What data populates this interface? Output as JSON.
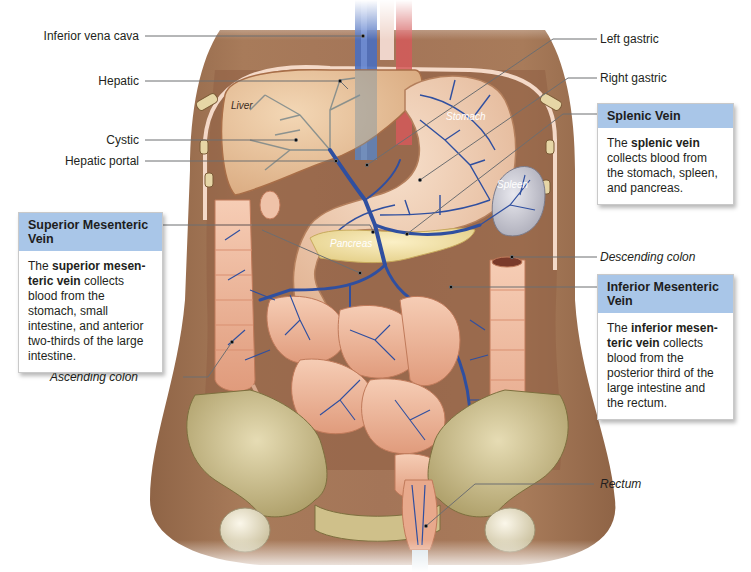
{
  "figure": {
    "top_cut_text": "Hepatic Portal System, continued",
    "organ_labels": [
      {
        "id": "liver",
        "text": "Liver"
      },
      {
        "id": "stomach",
        "text": "Stomach"
      },
      {
        "id": "spleen",
        "text": "Spleen"
      },
      {
        "id": "pancreas",
        "text": "Pancreas"
      }
    ],
    "left_labels": [
      {
        "id": "inferior-vena-cava",
        "text": "Inferior vena cava"
      },
      {
        "id": "hepatic",
        "text": "Hepatic"
      },
      {
        "id": "cystic",
        "text": "Cystic"
      },
      {
        "id": "hepatic-portal",
        "text": "Hepatic portal"
      },
      {
        "id": "ascending-colon",
        "text": "Ascending colon"
      }
    ],
    "right_labels": [
      {
        "id": "left-gastric",
        "text": "Left gastric"
      },
      {
        "id": "right-gastric",
        "text": "Right gastric"
      },
      {
        "id": "descending-colon",
        "text": "Descending colon"
      },
      {
        "id": "rectum",
        "text": "Rectum"
      }
    ],
    "info_boxes": {
      "splenic": {
        "title": "Splenic Vein",
        "body_pre": "The ",
        "body_bold": "splenic vein",
        "body_post": " collects blood from the stomach, spleen, and pancreas."
      },
      "superior_mesenteric": {
        "title": "Superior Mesenteric Vein",
        "body_pre": "The ",
        "body_bold": "superior mesen-teric vein",
        "body_post": " collects blood from the stomach, small intestine, and anterior two-thirds of the large intestine."
      },
      "inferior_mesenteric": {
        "title": "Inferior Mesenteric Vein",
        "body_pre": "The ",
        "body_bold": "inferior mesen-teric vein",
        "body_post": " collects blood from the posterior third of the large intestine and the rectum."
      }
    },
    "colors": {
      "box_header": "#a9c6e8",
      "vein_blue": "#2f4fa0",
      "leader_line": "#6d6e70",
      "skin": "#a2714f",
      "organ_tan": "#e9c69f"
    }
  }
}
